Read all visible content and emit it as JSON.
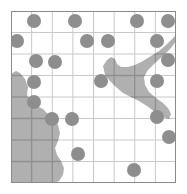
{
  "figure": {
    "name": "gridded-coastline-map-with-sample-points",
    "type": "map",
    "width": 187,
    "height": 194,
    "background_color": "#ffffff"
  },
  "map": {
    "name": "map-panel",
    "frame": {
      "x": 11,
      "y": 11,
      "width": 165,
      "height": 172
    },
    "border_color": "#8a8a8a",
    "land_color": "#b0b0b0",
    "water_color": "#ffffff",
    "grid": {
      "columns": 8,
      "rows": 8,
      "cell_width": 20.6,
      "cell_height": 21.5,
      "line_color_over_water": "#c9c9c9",
      "line_color_over_land": "#8f8f8f",
      "line_width": 1
    },
    "land_polygons": [
      {
        "name": "southwest-landmass",
        "points": "0,63 5,60 9,62 14,68 17,76 16,84 20,90 26,95 32,98 38,104 44,108 47,114 49,122 47,130 44,137 46,144 50,150 53,157 52,164 48,170 44,172 0,172"
      },
      {
        "name": "northeast-peninsula",
        "points": "92,55 96,49 100,46 104,48 106,53 110,56 117,56 124,54 132,50 140,45 148,40 155,34 161,28 165,24 165,30 160,37 152,45 144,52 137,59 133,66 134,74 138,81 145,87 152,92 157,97 160,103 158,108 152,106 144,101 136,95 128,90 120,86 112,82 105,76 99,70 94,64"
      }
    ],
    "points": {
      "name": "sample-point-markers",
      "marker_color": "#8e8e8e",
      "marker_diameter": 14,
      "count": 27,
      "cells": [
        [
          1,
          0
        ],
        [
          3,
          0
        ],
        [
          6,
          0
        ],
        [
          7,
          0
        ],
        [
          0,
          1
        ],
        [
          4,
          1
        ],
        [
          5,
          1
        ],
        [
          7,
          1
        ],
        [
          1,
          2
        ],
        [
          2,
          2
        ],
        [
          7,
          2
        ],
        [
          1,
          3
        ],
        [
          4,
          3
        ],
        [
          7,
          3
        ],
        [
          1,
          4
        ],
        [
          2,
          5
        ],
        [
          3,
          5
        ],
        [
          7,
          5
        ],
        [
          7,
          6
        ],
        [
          3,
          7
        ],
        [
          6,
          8
        ],
        [
          4,
          9
        ],
        [
          7,
          9
        ]
      ]
    }
  },
  "chart_data": {
    "type": "scatter",
    "title": "",
    "xlabel": "",
    "ylabel": "",
    "grid": true,
    "legend": "none",
    "xlim": [
      0,
      8
    ],
    "ylim": [
      0,
      8
    ],
    "markers": [
      {
        "col": 1,
        "row": 0,
        "cx": 23,
        "cy": 10
      },
      {
        "col": 3,
        "row": 0,
        "cx": 64,
        "cy": 10
      },
      {
        "col": 6,
        "row": 0,
        "cx": 126,
        "cy": 10
      },
      {
        "col": 7,
        "row": 0,
        "cx": 157,
        "cy": 10
      },
      {
        "col": 0,
        "row": 1,
        "cx": 6,
        "cy": 30
      },
      {
        "col": 4,
        "row": 1,
        "cx": 76,
        "cy": 30
      },
      {
        "col": 5,
        "row": 1,
        "cx": 97,
        "cy": 30
      },
      {
        "col": 7,
        "row": 1,
        "cx": 146,
        "cy": 30
      },
      {
        "col": 1,
        "row": 2,
        "cx": 25,
        "cy": 50
      },
      {
        "col": 2,
        "row": 2,
        "cx": 44,
        "cy": 51
      },
      {
        "col": 7,
        "row": 2,
        "cx": 157,
        "cy": 49
      },
      {
        "col": 1,
        "row": 3,
        "cx": 23,
        "cy": 71
      },
      {
        "col": 4,
        "row": 3,
        "cx": 90,
        "cy": 70
      },
      {
        "col": 7,
        "row": 3,
        "cx": 146,
        "cy": 70
      },
      {
        "col": 1,
        "row": 4,
        "cx": 23,
        "cy": 91
      },
      {
        "col": 2,
        "row": 5,
        "cx": 41,
        "cy": 108
      },
      {
        "col": 3,
        "row": 5,
        "cx": 61,
        "cy": 108
      },
      {
        "col": 7,
        "row": 5,
        "cx": 146,
        "cy": 106
      },
      {
        "col": 7,
        "row": 6,
        "cx": 158,
        "cy": 126
      },
      {
        "col": 3,
        "row": 7,
        "cx": 67,
        "cy": 143
      },
      {
        "col": 6,
        "row": 8,
        "cx": 123,
        "cy": 159
      },
      {
        "col": 4,
        "row": 9,
        "cx": 84,
        "cy": 178
      },
      {
        "col": 7,
        "row": 9,
        "cx": 146,
        "cy": 178
      }
    ]
  }
}
